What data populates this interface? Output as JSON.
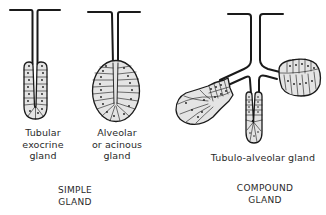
{
  "diagram": {
    "type": "exocrine gland types illustration",
    "stroke_color": "#1a1a1a",
    "fill_color": "#e6e6e6",
    "glands": [
      {
        "id": "tubular",
        "label_lines": [
          "Tubular",
          "exocrine",
          "gland"
        ],
        "category": "simple"
      },
      {
        "id": "alveolar",
        "label_lines": [
          "Alveolar",
          "or acinous",
          "gland"
        ],
        "category": "simple"
      },
      {
        "id": "tubulo-alveolar",
        "label_lines": [
          "Tubulo-alveolar gland"
        ],
        "category": "compound"
      }
    ],
    "groups": [
      {
        "id": "simple",
        "label_lines": [
          "SIMPLE",
          "GLAND"
        ]
      },
      {
        "id": "compound",
        "label_lines": [
          "COMPOUND",
          "GLAND"
        ]
      }
    ]
  }
}
